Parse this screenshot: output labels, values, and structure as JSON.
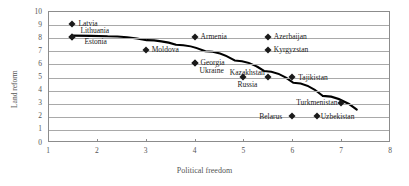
{
  "chart_data": {
    "type": "scatter",
    "title": "",
    "xlabel": "Political freedom",
    "ylabel": "Land reform",
    "xlim": [
      1,
      8
    ],
    "ylim": [
      0,
      10
    ],
    "xticks": [
      1,
      2,
      3,
      4,
      5,
      6,
      7,
      8
    ],
    "yticks": [
      0,
      1,
      2,
      3,
      4,
      5,
      6,
      7,
      8,
      9,
      10
    ],
    "grid": "horizontal",
    "legend": "none",
    "marker_color": "#1a1a1a",
    "marker_shape": "diamond",
    "points": [
      {
        "label": "Latvia",
        "x": 1.5,
        "y": 9,
        "label_dx": 6,
        "label_dy": -4
      },
      {
        "label": "Lithuania",
        "x": 1.5,
        "y": 8,
        "label_dx": 8,
        "label_dy": -10
      },
      {
        "label": "Estonia",
        "x": 1.5,
        "y": 8,
        "label_dx": 12,
        "label_dy": 1
      },
      {
        "label": "Moldova",
        "x": 3.0,
        "y": 7,
        "label_dx": 6,
        "label_dy": -4
      },
      {
        "label": "Armenia",
        "x": 4.0,
        "y": 8,
        "label_dx": 6,
        "label_dy": -4
      },
      {
        "label": "Georgia",
        "x": 4.0,
        "y": 6,
        "label_dx": 6,
        "label_dy": -4
      },
      {
        "label": "Ukraine",
        "x": 4.0,
        "y": 6,
        "label_dx": 5,
        "label_dy": 4
      },
      {
        "label": "Azerbaijan",
        "x": 5.5,
        "y": 8,
        "label_dx": 6,
        "label_dy": -4
      },
      {
        "label": "Kyrgyzstan",
        "x": 5.5,
        "y": 7,
        "label_dx": 6,
        "label_dy": -4
      },
      {
        "label": "Kazakhstan",
        "x": 5.5,
        "y": 5,
        "label_dx": -38,
        "label_dy": -8
      },
      {
        "label": "Russia",
        "x": 5.0,
        "y": 5,
        "label_dx": -6,
        "label_dy": 4
      },
      {
        "label": "Tajikistan",
        "x": 6.0,
        "y": 5,
        "label_dx": 6,
        "label_dy": -3
      },
      {
        "label": "Turkmenistan",
        "x": 7.0,
        "y": 3,
        "label_dx": -45,
        "label_dy": -4
      },
      {
        "label": "Belarus",
        "x": 6.0,
        "y": 2,
        "label_dx": -33,
        "label_dy": -3
      },
      {
        "label": "Uzbekistan",
        "x": 6.5,
        "y": 2,
        "label_dx": 4,
        "label_dy": -3
      }
    ],
    "trendline": {
      "visible": true,
      "color": "#000000",
      "points": [
        {
          "x": 1.5,
          "y": 8.2
        },
        {
          "x": 2.2,
          "y": 8.15
        },
        {
          "x": 3.0,
          "y": 7.85
        },
        {
          "x": 3.6,
          "y": 7.5
        },
        {
          "x": 4.2,
          "y": 7.0
        },
        {
          "x": 4.8,
          "y": 6.3
        },
        {
          "x": 5.4,
          "y": 5.5
        },
        {
          "x": 6.0,
          "y": 4.6
        },
        {
          "x": 6.6,
          "y": 3.6
        },
        {
          "x": 7.3,
          "y": 2.55
        }
      ]
    }
  }
}
